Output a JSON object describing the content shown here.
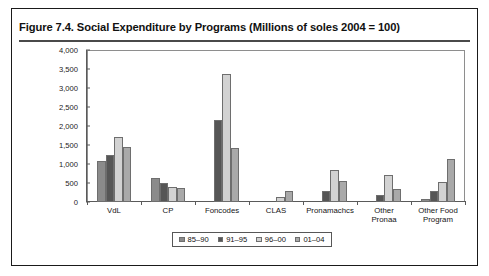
{
  "figure": {
    "title": "Figure 7.4.  Social Expenditure by Programs (Millions of soles 2004 = 100)"
  },
  "chart_data": {
    "type": "bar",
    "title": "Figure 7.4.  Social Expenditure by Programs (Millions of soles 2004 = 100)",
    "xlabel": "",
    "ylabel": "",
    "ylim": [
      0,
      4000
    ],
    "ytick_labels": [
      "4,000",
      "3,500",
      "3,000",
      "2,500",
      "2,000",
      "1,500",
      "1,000",
      "500",
      "0"
    ],
    "ytick_values": [
      4000,
      3500,
      3000,
      2500,
      2000,
      1500,
      1000,
      500,
      0
    ],
    "grid": false,
    "legend_position": "bottom",
    "categories": [
      "VdL",
      "CP",
      "Foncodes",
      "CLAS",
      "Pronamachcs",
      "Other\nPronaa",
      "Other Food\nProgram"
    ],
    "series": [
      {
        "name": "85–90",
        "color": "#8b8b8b",
        "values": [
          1090,
          620,
          0,
          0,
          0,
          0,
          80
        ]
      },
      {
        "name": "91–95",
        "color": "#565656",
        "values": [
          1250,
          490,
          2150,
          0,
          300,
          180,
          300
        ]
      },
      {
        "name": "96–00",
        "color": "#d2d2d2",
        "values": [
          1720,
          400,
          3380,
          130,
          830,
          720,
          530
        ]
      },
      {
        "name": "01–04",
        "color": "#a9a9a9",
        "values": [
          1450,
          360,
          1430,
          290,
          560,
          350,
          1120
        ]
      }
    ]
  }
}
